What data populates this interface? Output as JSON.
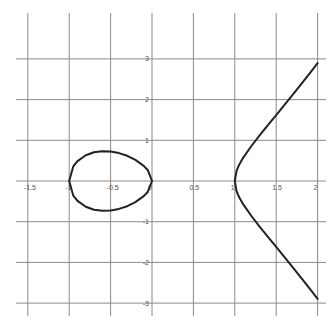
{
  "chart_data": {
    "type": "line",
    "title": "",
    "xlabel": "",
    "ylabel": "",
    "xlim": [
      -1.5,
      2
    ],
    "ylim": [
      -3,
      3
    ],
    "grid": true,
    "legend": null,
    "x_ticks": [
      -1.5,
      -1,
      -0.5,
      0,
      0.5,
      1,
      1.5,
      2
    ],
    "x_tick_labels": [
      "-1.5",
      "-1",
      "-0.5",
      "0",
      "0.5",
      "1",
      "1.5",
      "2"
    ],
    "y_ticks": [
      -3,
      -2,
      -1,
      1,
      2,
      3
    ],
    "y_tick_labels": [
      "-3",
      "-2",
      "-1",
      "1",
      "2",
      "3"
    ],
    "curve_description": "Elliptic-curve shape: closed oval between x=-1 and x=0, plus an open branch starting at x=1 opening to the right (approx. y^2 = 1.4(x^3 - x))",
    "series": [
      {
        "name": "oval",
        "closed": true,
        "x": [
          -1,
          -0.95,
          -0.9,
          -0.8,
          -0.7,
          -0.6,
          -0.5,
          -0.4,
          -0.3,
          -0.2,
          -0.1,
          -0.05,
          0
        ],
        "y_upper": [
          0,
          0.36,
          0.489,
          0.635,
          0.707,
          0.733,
          0.725,
          0.686,
          0.618,
          0.518,
          0.372,
          0.264,
          0
        ]
      },
      {
        "name": "right-branch",
        "closed": false,
        "x": [
          1,
          1.02,
          1.05,
          1.1,
          1.2,
          1.3,
          1.4,
          1.5,
          1.6,
          1.7,
          1.8,
          1.9,
          2.0
        ],
        "y_upper": [
          0,
          0.24,
          0.388,
          0.569,
          0.86,
          1.121,
          1.372,
          1.62,
          1.869,
          2.121,
          2.376,
          2.635,
          2.898
        ]
      }
    ],
    "colors": {
      "grid": "#8a8a8a",
      "curve": "#222222",
      "background": "#ffffff",
      "label": "#555555"
    }
  },
  "layout": {
    "origin_px": [
      152,
      181
    ],
    "px_per_x": 82.8,
    "px_per_y": 40.7,
    "grid_x_extent_px": [
      16,
      326
    ],
    "grid_y_extent_px": [
      13,
      316
    ]
  }
}
